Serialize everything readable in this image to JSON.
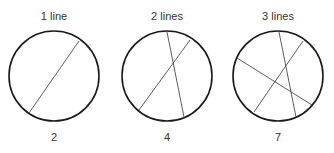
{
  "panels": [
    {
      "label": "1 line",
      "regions": "2",
      "line_count": 1
    },
    {
      "label": "2 lines",
      "regions": "4",
      "line_count": 2
    },
    {
      "label": "3 lines",
      "regions": "7",
      "line_count": 3
    }
  ],
  "colors": {
    "stroke": "#1a1a1a",
    "text": "#333333",
    "background": "#ffffff"
  }
}
